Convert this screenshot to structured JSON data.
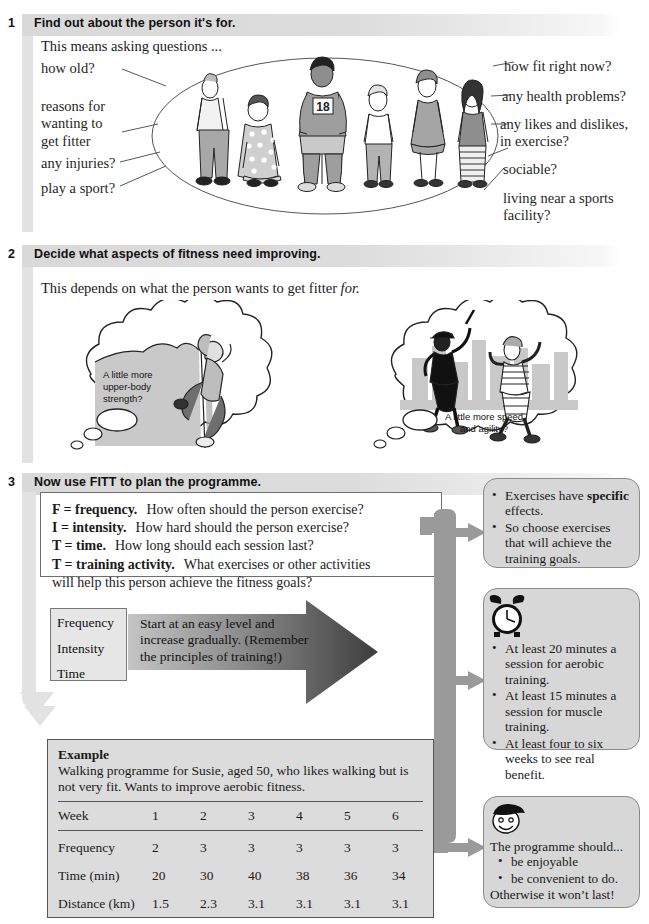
{
  "sections": [
    {
      "number": "1",
      "title": "Find out about the person it's for."
    },
    {
      "number": "2",
      "title": "Decide what aspects of fitness need improving."
    },
    {
      "number": "3",
      "title": "Now use FITT to plan the programme."
    }
  ],
  "section1": {
    "intro": "This means asking questions ...",
    "left_annotations": [
      "how old?",
      "reasons for\nwanting to\nget fitter",
      "any injuries?",
      "play a sport?"
    ],
    "right_annotations": [
      "how fit right now?",
      "any health problems?",
      "any likes and dislikes,\nin exercise?",
      "sociable?",
      "living near a sports\nfacility?"
    ],
    "figure_label": "18"
  },
  "section2": {
    "intro_plain": "This depends on what the person wants to get fitter ",
    "intro_italic": "for.",
    "bubble_left": "A little more\nupper-body\nstrength?",
    "bubble_right": "A little more speed\nand agility?"
  },
  "section3": {
    "fitt": [
      {
        "key": "F = frequency.",
        "text": "How often should the person exercise?"
      },
      {
        "key": "I = intensity.",
        "text": "How hard should the person exercise?"
      },
      {
        "key": "T = time.",
        "text": "How long should each session last?"
      },
      {
        "key": "T = training activity.",
        "text": "What exercises or other activities"
      }
    ],
    "fitt_tail": "will help this person achieve the fitness goals?",
    "fit_box": [
      "Frequency",
      "Intensity",
      "Time"
    ],
    "arrow_text": "Start at an easy level and increase gradually. (Remember the principles of training!)",
    "example": {
      "title": "Example",
      "description": "Walking programme for Susie, aged 50, who likes walking but is not very fit. Wants to improve aerobic fitness.",
      "header": [
        "Week",
        "1",
        "2",
        "3",
        "4",
        "5",
        "6"
      ],
      "rows": [
        {
          "label": "Frequency",
          "values": [
            "2",
            "3",
            "3",
            "3",
            "3",
            "3"
          ]
        },
        {
          "label": "Time (min)",
          "values": [
            "20",
            "30",
            "40",
            "38",
            "36",
            "34"
          ]
        },
        {
          "label": "Distance (km)",
          "values": [
            "1.5",
            "2.3",
            "3.1",
            "3.1",
            "3.1",
            "3.1"
          ]
        }
      ]
    },
    "callouts": [
      {
        "icon": "none",
        "bullets": [
          "Exercises have specific effects.",
          "So choose exercises that will achieve the training goals."
        ],
        "bold_word": "specific"
      },
      {
        "icon": "alarm-clock-icon",
        "bullets": [
          "At least 20 minutes a session for aerobic training.",
          "At least 15 minutes a session for muscle training.",
          "At least four to six weeks to see real benefit."
        ]
      },
      {
        "icon": "smiley-face-icon",
        "intro": "The programme should...",
        "bullets": [
          "be enjoyable",
          "be convenient to do."
        ],
        "outro": "Otherwise it won’t last!"
      }
    ]
  },
  "colors": {
    "header_bar": "#dcdcdc",
    "rail": "#e2e2e2",
    "callout_bg": "#d7d7d7",
    "callout_border": "#8a8a8a",
    "arrow_gray": "#9a9a9a",
    "table_bg": "#dcdcdc"
  }
}
